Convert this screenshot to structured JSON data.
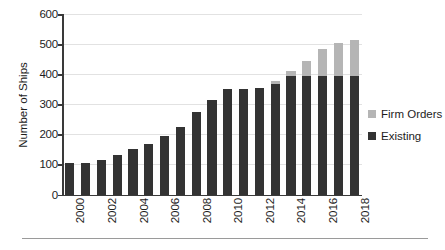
{
  "chart_data": {
    "type": "bar",
    "title": "",
    "xlabel": "",
    "ylabel": "Number of Ships",
    "ylim": [
      0,
      600
    ],
    "ytick_values": [
      0,
      100,
      200,
      300,
      400,
      500,
      600
    ],
    "ytick_labels": [
      "0",
      "100",
      "200",
      "300",
      "400",
      "500",
      "600"
    ],
    "grid": true,
    "stacked": true,
    "legend_position": "right",
    "categories": [
      "2000",
      "2001",
      "2002",
      "2003",
      "2004",
      "2005",
      "2006",
      "2007",
      "2008",
      "2009",
      "2010",
      "2011",
      "2012",
      "2013",
      "2014",
      "2015",
      "2016",
      "2017",
      "2018"
    ],
    "xtick_labels_shown": [
      "2000",
      "2002",
      "2004",
      "2006",
      "2008",
      "2010",
      "2012",
      "2014",
      "2016",
      "2018"
    ],
    "series": [
      {
        "name": "Existing",
        "color": "#333333",
        "values": [
          105,
          106,
          115,
          130,
          150,
          167,
          193,
          223,
          273,
          315,
          350,
          352,
          353,
          368,
          395,
          395,
          395,
          395,
          395
        ]
      },
      {
        "name": "Firm Orders",
        "color": "#b5b5b5",
        "values": [
          0,
          0,
          0,
          0,
          0,
          0,
          0,
          0,
          0,
          0,
          0,
          0,
          0,
          10,
          17,
          50,
          90,
          110,
          118
        ]
      }
    ],
    "totals": [
      105,
      106,
      115,
      130,
      150,
      167,
      193,
      223,
      273,
      315,
      350,
      352,
      353,
      378,
      412,
      445,
      485,
      505,
      513
    ]
  },
  "legend": {
    "items": [
      {
        "label": "Firm Orders",
        "color": "#b5b5b5"
      },
      {
        "label": "Existing",
        "color": "#333333"
      }
    ]
  }
}
